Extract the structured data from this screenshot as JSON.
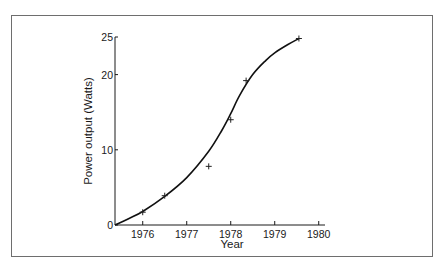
{
  "chart_data": {
    "type": "line",
    "title": "",
    "xlabel": "Year",
    "ylabel": "Power output (Watts)",
    "xlim": [
      1975.37,
      1980
    ],
    "ylim": [
      0,
      25
    ],
    "x_ticks": [
      1976,
      1977,
      1978,
      1979,
      1980
    ],
    "y_ticks": [
      0,
      10,
      20,
      25
    ],
    "grid": false,
    "legend": null,
    "series": [
      {
        "name": "Measured",
        "marker": "+",
        "style": "scatter",
        "x": [
          1976.0,
          1976.5,
          1977.5,
          1978.0,
          1978.35,
          1979.55
        ],
        "y": [
          1.7,
          3.9,
          7.8,
          14.0,
          19.2,
          24.8
        ]
      },
      {
        "name": "Fitted curve",
        "style": "line",
        "x": [
          1975.37,
          1975.7,
          1976.0,
          1976.5,
          1977.0,
          1977.5,
          1977.8,
          1978.0,
          1978.2,
          1978.5,
          1978.8,
          1979.0,
          1979.3,
          1979.55
        ],
        "y": [
          0,
          0.9,
          1.8,
          3.8,
          6.3,
          9.8,
          12.6,
          14.8,
          17.2,
          20.0,
          21.9,
          22.9,
          24.0,
          24.8
        ]
      }
    ]
  },
  "labels": {
    "xlabel": "Year",
    "ylabel": "Power output (Watts)",
    "x_ticks": [
      "1976",
      "1977",
      "1978",
      "1979",
      "1980"
    ],
    "y_ticks": [
      "0",
      "10",
      "20",
      "25"
    ]
  }
}
